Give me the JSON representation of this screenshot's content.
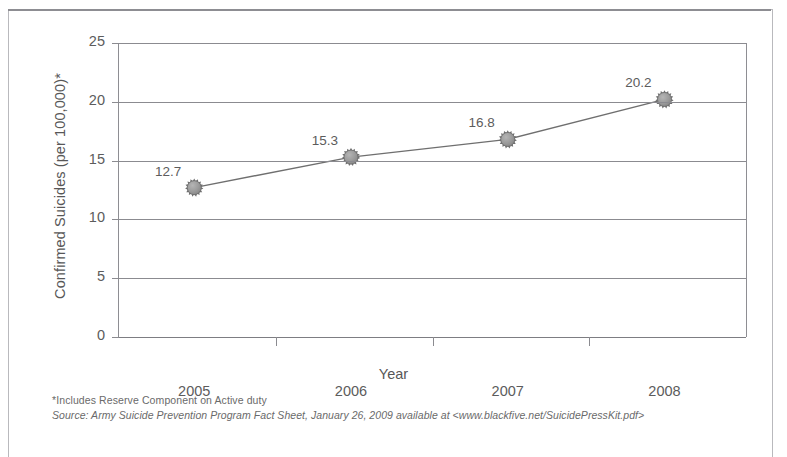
{
  "figure": {
    "y_axis_title": "Confirmed Suicides (per 100,000)*",
    "x_axis_title": "Year",
    "footnote_asterisk": "*Includes Reserve Component on Active duty",
    "footnote_source": "Source: Army Suicide Prevention Program Fact Sheet, January 26, 2009 available at <www.blackfive.net/SuicidePressKit.pdf>"
  },
  "colors": {
    "marker_fill": "#9a9a9a",
    "marker_stroke": "#6f6f6f",
    "line": "#6f6f6f",
    "grid": "#8b8b90",
    "text": "#5c5c5c",
    "frame": "#b9b9bd"
  },
  "chart_data": {
    "type": "line",
    "title": "",
    "subtitle": "",
    "xlabel": "Year",
    "ylabel": "Confirmed Suicides (per 100,000)*",
    "categories": [
      "2005",
      "2006",
      "2007",
      "2008"
    ],
    "x": [
      2005,
      2006,
      2007,
      2008
    ],
    "values": [
      12.7,
      15.3,
      16.8,
      20.2
    ],
    "point_labels": [
      "12.7",
      "15.3",
      "16.8",
      "20.2"
    ],
    "ylim": [
      0,
      25
    ],
    "yticks": [
      0,
      5,
      10,
      15,
      20,
      25
    ],
    "ytick_labels": [
      "0",
      "5",
      "10",
      "15",
      "20",
      "25"
    ],
    "grid": true,
    "grid_axis": "y",
    "legend": false,
    "legend_position": "none",
    "marker": "starburst-circle",
    "series": [
      {
        "name": "Confirmed Suicides (per 100,000)",
        "values": [
          12.7,
          15.3,
          16.8,
          20.2
        ]
      }
    ],
    "annotations": [
      "*Includes Reserve Component on Active duty",
      "Source: Army Suicide Prevention Program Fact Sheet, January 26, 2009 available at <www.blackfive.net/SuicidePressKit.pdf>"
    ]
  }
}
